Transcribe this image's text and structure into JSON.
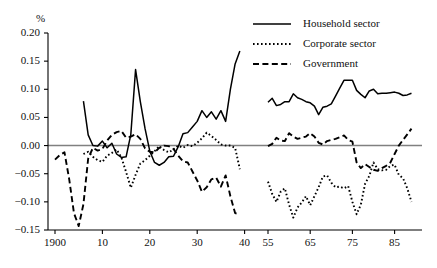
{
  "chart_data": {
    "type": "line",
    "title": "",
    "subtitle": "",
    "xlabel": "",
    "ylabel": "%",
    "unit_label": "%",
    "grid": false,
    "zero_line": true,
    "legend_position": "top-right",
    "axis_break": {
      "after": 1939,
      "before": 1955
    },
    "xlim_panel1": [
      1900,
      1939
    ],
    "xlim_panel2": [
      1955,
      1989
    ],
    "ylim": [
      -0.15,
      0.2
    ],
    "ytick_labels": [
      "0.20",
      "0.15",
      "0.10",
      "0.05",
      "0.00",
      "−0.05",
      "−0.10",
      "−0.15"
    ],
    "ytick_values": [
      0.2,
      0.15,
      0.1,
      0.05,
      0.0,
      -0.05,
      -0.1,
      -0.15
    ],
    "xtick_labels": [
      "1900",
      "10",
      "20",
      "30",
      "40",
      "55",
      "65",
      "75",
      "85"
    ],
    "xtick_values": [
      1900,
      1910,
      1920,
      1930,
      1940,
      1955,
      1965,
      1975,
      1985
    ],
    "series": [
      {
        "name": "Household sector",
        "style": "solid",
        "color": "#000000",
        "x": [
          1906,
          1907,
          1908,
          1909,
          1910,
          1911,
          1912,
          1913,
          1914,
          1915,
          1916,
          1917,
          1918,
          1919,
          1920,
          1921,
          1922,
          1923,
          1924,
          1925,
          1926,
          1927,
          1928,
          1929,
          1930,
          1931,
          1932,
          1933,
          1934,
          1935,
          1936,
          1937,
          1938,
          1939
        ],
        "values": [
          0.079,
          0.019,
          0.0,
          -0.001,
          0.008,
          -0.004,
          0.004,
          -0.015,
          -0.021,
          -0.02,
          0.02,
          0.135,
          0.078,
          0.03,
          -0.01,
          -0.03,
          -0.035,
          -0.03,
          -0.02,
          -0.019,
          -0.002,
          0.021,
          0.023,
          0.033,
          0.043,
          0.062,
          0.05,
          0.06,
          0.047,
          0.062,
          0.043,
          0.1,
          0.145,
          0.168
        ]
      },
      {
        "name": "Household sector (post-war)",
        "style": "solid",
        "color": "#000000",
        "x": [
          1955,
          1956,
          1957,
          1958,
          1959,
          1960,
          1961,
          1962,
          1963,
          1964,
          1965,
          1966,
          1967,
          1968,
          1969,
          1970,
          1971,
          1972,
          1973,
          1974,
          1975,
          1976,
          1977,
          1978,
          1979,
          1980,
          1981,
          1982,
          1983,
          1984,
          1985,
          1986,
          1987,
          1988,
          1989
        ],
        "values": [
          0.077,
          0.084,
          0.071,
          0.073,
          0.078,
          0.078,
          0.092,
          0.085,
          0.082,
          0.078,
          0.076,
          0.07,
          0.055,
          0.068,
          0.07,
          0.074,
          0.088,
          0.102,
          0.116,
          0.116,
          0.116,
          0.098,
          0.091,
          0.085,
          0.097,
          0.1,
          0.092,
          0.093,
          0.093,
          0.094,
          0.095,
          0.093,
          0.089,
          0.09,
          0.093
        ]
      },
      {
        "name": "Corporate sector",
        "style": "dotted",
        "color": "#000000",
        "x": [
          1906,
          1907,
          1908,
          1909,
          1910,
          1911,
          1912,
          1913,
          1914,
          1915,
          1916,
          1917,
          1918,
          1919,
          1920,
          1921,
          1922,
          1923,
          1924,
          1925,
          1926,
          1927,
          1928,
          1929,
          1930,
          1931,
          1932,
          1933,
          1934,
          1935,
          1936,
          1937,
          1938,
          1939
        ],
        "values": [
          -0.015,
          -0.011,
          -0.02,
          -0.026,
          -0.029,
          -0.018,
          -0.013,
          -0.007,
          -0.021,
          -0.047,
          -0.075,
          -0.052,
          -0.032,
          -0.026,
          -0.018,
          -0.01,
          -0.001,
          -0.008,
          -0.012,
          -0.007,
          0.0,
          -0.004,
          0.001,
          -0.001,
          0.005,
          0.013,
          0.023,
          0.017,
          0.01,
          0.002,
          0.0,
          0.0,
          -0.004,
          -0.042
        ]
      },
      {
        "name": "Corporate sector (post-war)",
        "style": "dotted",
        "color": "#000000",
        "x": [
          1955,
          1956,
          1957,
          1958,
          1959,
          1960,
          1961,
          1962,
          1963,
          1964,
          1965,
          1966,
          1967,
          1968,
          1969,
          1970,
          1971,
          1972,
          1973,
          1974,
          1975,
          1976,
          1977,
          1978,
          1979,
          1980,
          1981,
          1982,
          1983,
          1984,
          1985,
          1986,
          1987,
          1988,
          1989
        ],
        "values": [
          -0.064,
          -0.086,
          -0.1,
          -0.082,
          -0.076,
          -0.105,
          -0.128,
          -0.11,
          -0.101,
          -0.09,
          -0.106,
          -0.09,
          -0.074,
          -0.055,
          -0.053,
          -0.066,
          -0.074,
          -0.073,
          -0.076,
          -0.072,
          -0.1,
          -0.122,
          -0.105,
          -0.068,
          -0.054,
          -0.03,
          -0.042,
          -0.044,
          -0.043,
          -0.036,
          -0.034,
          -0.052,
          -0.058,
          -0.076,
          -0.1
        ]
      },
      {
        "name": "Government",
        "style": "dashed",
        "color": "#000000",
        "x": [
          1900,
          1901,
          1902,
          1903,
          1904,
          1905,
          1906,
          1907,
          1908,
          1909,
          1910,
          1911,
          1912,
          1913,
          1914,
          1915,
          1916,
          1917,
          1918,
          1919,
          1920,
          1921,
          1922,
          1923,
          1924,
          1925,
          1926,
          1927,
          1928,
          1929,
          1930,
          1931,
          1932,
          1933,
          1934,
          1935,
          1936,
          1937,
          1938,
          1939
        ],
        "values": [
          -0.025,
          -0.017,
          -0.012,
          -0.06,
          -0.12,
          -0.143,
          -0.104,
          -0.023,
          -0.004,
          -0.009,
          -0.006,
          0.009,
          0.019,
          0.024,
          0.026,
          0.014,
          0.016,
          0.02,
          0.012,
          -0.005,
          -0.011,
          -0.012,
          -0.004,
          0.0,
          -0.001,
          -0.006,
          -0.018,
          -0.028,
          -0.03,
          -0.046,
          -0.062,
          -0.082,
          -0.074,
          -0.06,
          -0.057,
          -0.073,
          -0.053,
          -0.09,
          -0.12,
          -0.122
        ]
      },
      {
        "name": "Government (post-war)",
        "style": "dashed",
        "color": "#000000",
        "x": [
          1955,
          1956,
          1957,
          1958,
          1959,
          1960,
          1961,
          1962,
          1963,
          1964,
          1965,
          1966,
          1967,
          1968,
          1969,
          1970,
          1971,
          1972,
          1973,
          1974,
          1975,
          1976,
          1977,
          1978,
          1979,
          1980,
          1981,
          1982,
          1983,
          1984,
          1985,
          1986,
          1987,
          1988,
          1989
        ],
        "values": [
          -0.001,
          0.003,
          0.014,
          0.009,
          0.008,
          0.022,
          0.016,
          0.012,
          0.014,
          0.016,
          0.022,
          0.016,
          0.005,
          0.002,
          0.008,
          0.01,
          0.012,
          0.015,
          0.018,
          0.01,
          0.007,
          -0.03,
          -0.04,
          -0.033,
          -0.038,
          -0.043,
          -0.045,
          -0.04,
          -0.036,
          -0.03,
          -0.015,
          0.0,
          0.01,
          0.02,
          0.03
        ]
      }
    ],
    "legend": [
      {
        "label": "Household sector",
        "style": "solid"
      },
      {
        "label": "Corporate sector",
        "style": "dotted"
      },
      {
        "label": "Government",
        "style": "dashed"
      }
    ]
  }
}
